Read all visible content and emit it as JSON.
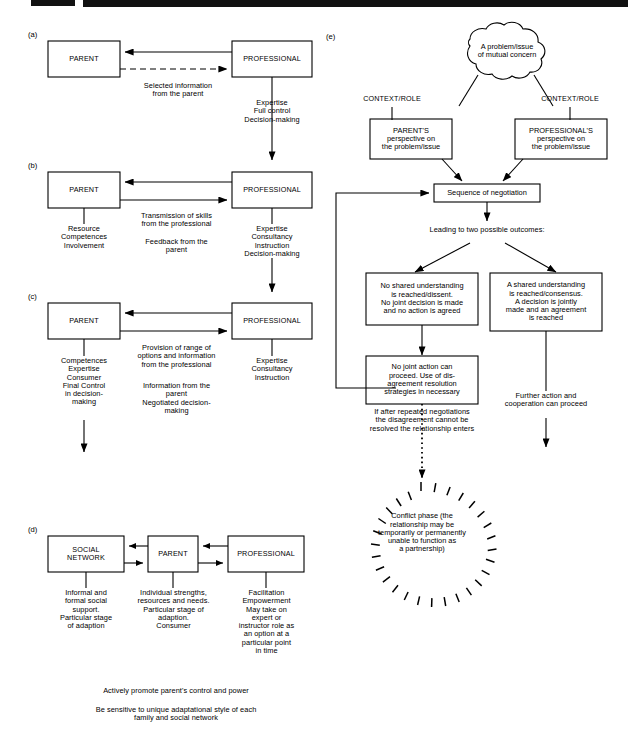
{
  "figure": {
    "title_band": "page-header-rule",
    "panels": [
      {
        "id": "a",
        "letter": "(a)",
        "boxes": [
          {
            "name": "parent",
            "label": "PARENT"
          },
          {
            "name": "professional",
            "label": "PROFESSIONAL"
          }
        ],
        "annotations": [
          {
            "name": "selected-information",
            "text": "Selected information\nfrom the parent"
          },
          {
            "name": "professional-attributes",
            "text": "Expertise\nFull control\nDecision-making"
          }
        ]
      },
      {
        "id": "b",
        "letter": "(b)",
        "boxes": [
          {
            "name": "parent",
            "label": "PARENT"
          },
          {
            "name": "professional",
            "label": "PROFESSIONAL"
          }
        ],
        "annotations": [
          {
            "name": "parent-attributes",
            "text": "Resource\nCompetences\nInvolvement"
          },
          {
            "name": "transmission-of-skills",
            "text": "Transmission of skills\nfrom the professional"
          },
          {
            "name": "feedback-from-parent",
            "text": "Feedback from the\nparent"
          },
          {
            "name": "professional-attributes",
            "text": "Expertise\nConsultancy\nInstruction\nDecision-making"
          }
        ]
      },
      {
        "id": "c",
        "letter": "(c)",
        "boxes": [
          {
            "name": "parent",
            "label": "PARENT"
          },
          {
            "name": "professional",
            "label": "PROFESSIONAL"
          }
        ],
        "annotations": [
          {
            "name": "parent-attributes",
            "text": "Competences\nExpertise\nConsumer\nFinal Control\nin decision-\nmaking"
          },
          {
            "name": "provision-of-options",
            "text": "Provision of range of\noptions and information\nfrom the professional"
          },
          {
            "name": "information-from-parent",
            "text": "Information from the\nparent\nNegotiated decision-\nmaking"
          },
          {
            "name": "professional-attributes",
            "text": "Expertise\nConsultancy\nInstruction"
          }
        ]
      },
      {
        "id": "d",
        "letter": "(d)",
        "boxes": [
          {
            "name": "social-network",
            "label": "SOCIAL\nNETWORK"
          },
          {
            "name": "parent",
            "label": "PARENT"
          },
          {
            "name": "professional",
            "label": "PROFESSIONAL"
          }
        ],
        "annotations": [
          {
            "name": "social-network-attributes",
            "text": "Informal and\nformal social\nsupport.\nParticular stage\nof adaption"
          },
          {
            "name": "parent-attributes",
            "text": "Individual strengths,\nresources and needs.\nParticular stage of\nadaption.\nConsumer"
          },
          {
            "name": "professional-attributes",
            "text": "Facilitation\nEmpowerment\nMay take on\nexpert or\ninstructor role as\nan option at a\nparticular point\nin time"
          },
          {
            "name": "footer-line-1",
            "text": "Actively promote parent's control and power"
          },
          {
            "name": "footer-line-2",
            "text": "Be sensitive to unique adaptational style of each\nfamily and social network"
          }
        ]
      },
      {
        "id": "e",
        "letter": "(e)",
        "boxes": [
          {
            "name": "problem-cloud",
            "label": "A problem/issue\nof mutual concern"
          },
          {
            "name": "parent-perspective",
            "label": "PARENT'S\nperspective on\nthe problem/issue"
          },
          {
            "name": "professional-perspective",
            "label": "PROFESSIONAL'S\nperspective on\nthe problem/issue"
          },
          {
            "name": "sequence-of-negotiation",
            "label": "Sequence of negotiation"
          },
          {
            "name": "no-shared-understanding",
            "label": "No shared understanding\nis reached/dissent.\nNo joint decision is made\nand no action is agreed"
          },
          {
            "name": "shared-understanding",
            "label": "A shared understanding\nis reached/consensus.\nA decision is jointly\nmade and an agreement\nis reached"
          },
          {
            "name": "no-joint-action",
            "label": "No joint action can\nproceed. Use of dis-\nagreement resolution\nstrategies in necessary"
          },
          {
            "name": "conflict-phase",
            "label": "Conflict phase (the\nrelationship may be\ntemporarily or permanently\nunable to function as\na partnership)"
          }
        ],
        "annotations": [
          {
            "name": "context-role-left",
            "text": "CONTEXT/ROLE"
          },
          {
            "name": "context-role-right",
            "text": "CONTEXT/ROLE"
          },
          {
            "name": "two-outcomes",
            "text": "Leading to two possible outcomes:"
          },
          {
            "name": "repeated-negotiations",
            "text": "If after repeated negotiations\nthe disagreement cannot be\nresolved the relationship enters"
          },
          {
            "name": "further-action",
            "text": "Further action and\ncooperation can proceed"
          }
        ]
      }
    ]
  },
  "colors": {
    "ink": "#000000",
    "paper": "#ffffff",
    "header_band": "#111111"
  }
}
